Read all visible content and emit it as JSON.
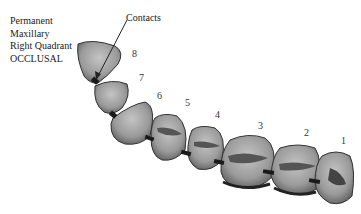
{
  "title_lines": [
    "Permanent",
    "Maxillary",
    "Right Quadrant",
    "OCCLUSAL"
  ],
  "contacts_label": "Contacts",
  "teeth": [
    {
      "number": "1",
      "x": 343,
      "y": 143
    },
    {
      "number": "2",
      "x": 306,
      "y": 135
    },
    {
      "number": "3",
      "x": 258,
      "y": 123
    },
    {
      "number": "4",
      "x": 215,
      "y": 113
    },
    {
      "number": "5",
      "x": 185,
      "y": 103
    },
    {
      "number": "6",
      "x": 157,
      "y": 96
    },
    {
      "number": "7",
      "x": 137,
      "y": 77
    },
    {
      "number": "8",
      "x": 132,
      "y": 55
    }
  ],
  "colors": {
    "tooth_fill": "#9a9a9a",
    "tooth_dark": "#4a4a4a",
    "contact": "#1a1a1a"
  }
}
